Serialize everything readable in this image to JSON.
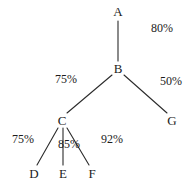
{
  "diagram": {
    "type": "tree",
    "title": "",
    "background_color": "#ffffff",
    "stroke_color": "#2b2b2b",
    "text_color": "#1c1c1c",
    "nodes": [
      {
        "id": "A",
        "label": "A",
        "x": 118,
        "y": 11
      },
      {
        "id": "B",
        "label": "B",
        "x": 118,
        "y": 68
      },
      {
        "id": "C",
        "label": "C",
        "x": 62,
        "y": 120
      },
      {
        "id": "D",
        "label": "D",
        "x": 34,
        "y": 173
      },
      {
        "id": "E",
        "label": "E",
        "x": 63,
        "y": 173
      },
      {
        "id": "F",
        "label": "F",
        "x": 92,
        "y": 173
      },
      {
        "id": "G",
        "label": "G",
        "x": 172,
        "y": 120
      }
    ],
    "edges": [
      {
        "from": "A",
        "to": "B",
        "x1": 118,
        "y1": 21,
        "x2": 118,
        "y2": 61,
        "label": "80%",
        "label_x": 162,
        "label_y": 28
      },
      {
        "from": "B",
        "to": "C",
        "x1": 112,
        "y1": 75,
        "x2": 67,
        "y2": 113,
        "label": "75%",
        "label_x": 66,
        "label_y": 79
      },
      {
        "from": "B",
        "to": "G",
        "x1": 124,
        "y1": 75,
        "x2": 167,
        "y2": 113,
        "label": "50%",
        "label_x": 171,
        "label_y": 81
      },
      {
        "from": "C",
        "to": "D",
        "x1": 58,
        "y1": 128,
        "x2": 37,
        "y2": 165,
        "label": "75%",
        "label_x": 23,
        "label_y": 139
      },
      {
        "from": "C",
        "to": "E",
        "x1": 63,
        "y1": 128,
        "x2": 63,
        "y2": 165,
        "label": "85%",
        "label_x": 69,
        "label_y": 144
      },
      {
        "from": "C",
        "to": "F",
        "x1": 67,
        "y1": 128,
        "x2": 89,
        "y2": 165,
        "label": "92%",
        "label_x": 112,
        "label_y": 139
      }
    ]
  }
}
